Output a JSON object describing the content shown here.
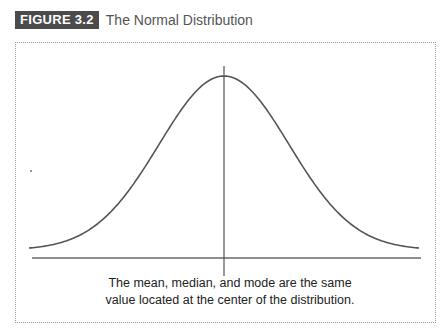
{
  "figure": {
    "label": "FIGURE 3.2",
    "title": "The Normal Distribution",
    "badge_color": "#4b4b4b",
    "caption_line1": "The mean, median, and mode are the same",
    "caption_line2": "value located at the center of the distribution."
  },
  "chart_data": {
    "type": "line",
    "title": "The Normal Distribution",
    "xlabel": "",
    "ylabel": "",
    "x": [
      -3,
      -2.5,
      -2,
      -1.5,
      -1,
      -0.5,
      0,
      0.5,
      1,
      1.5,
      2,
      2.5,
      3
    ],
    "series": [
      {
        "name": "normal density",
        "values": [
          0.004,
          0.018,
          0.054,
          0.13,
          0.242,
          0.352,
          0.399,
          0.352,
          0.242,
          0.13,
          0.054,
          0.018,
          0.004
        ]
      }
    ],
    "annotations": [
      "Vertical line at center (x = 0)",
      "The mean, median, and mode are the same value located at the center of the distribution."
    ],
    "grid": false,
    "legend": "none",
    "line_color": "#555555"
  }
}
